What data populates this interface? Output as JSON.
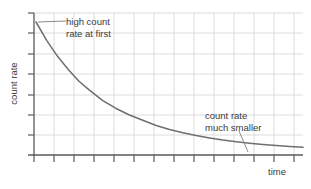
{
  "chart_data": {
    "type": "line",
    "title": "",
    "xlabel": "time",
    "ylabel": "count rate",
    "grid": true,
    "legend": null,
    "xlim": [
      0,
      1
    ],
    "ylim": [
      0,
      1
    ],
    "axis_ticks": {
      "x_count": 14,
      "y_count": 8,
      "labels_shown": false
    },
    "series": [
      {
        "name": "radioactive decay count rate",
        "color": "#6e6e6e",
        "x": [
          0.0,
          0.04,
          0.08,
          0.12,
          0.16,
          0.2,
          0.25,
          0.3,
          0.35,
          0.4,
          0.45,
          0.5,
          0.55,
          0.6,
          0.65,
          0.7,
          0.75,
          0.8,
          0.85,
          0.9,
          0.95,
          1.0
        ],
        "y": [
          1.0,
          0.86,
          0.74,
          0.64,
          0.55,
          0.48,
          0.4,
          0.34,
          0.29,
          0.25,
          0.21,
          0.18,
          0.155,
          0.133,
          0.115,
          0.099,
          0.086,
          0.075,
          0.065,
          0.057,
          0.05,
          0.044
        ]
      }
    ],
    "annotations": [
      {
        "id": "high",
        "text": "high count\nrate at first",
        "target_x": 0.015,
        "target_y": 0.97
      },
      {
        "id": "small",
        "text": "count rate\nmuch smaller",
        "target_x": 0.87,
        "target_y": 0.06
      }
    ]
  },
  "axes": {
    "y_label": "count rate",
    "x_label": "time"
  },
  "annotations": {
    "high_line1": "high count",
    "high_line2": "rate at first",
    "small_line1": "count rate",
    "small_line2": "much smaller"
  },
  "colors": {
    "curve": "#6e6e6e",
    "axis": "#5a5a5a",
    "grid": "#dcdcdc",
    "text": "#3a3a3a",
    "leader": "#8a8a8a",
    "background": "#ffffff"
  }
}
